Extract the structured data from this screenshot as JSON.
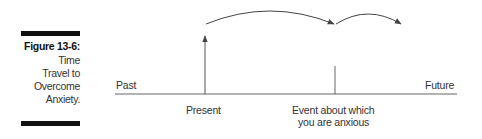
{
  "figure": {
    "number": "Figure 13-6:",
    "caption_lines": [
      "Time",
      "Travel to",
      "Overcome",
      "Anxiety."
    ]
  },
  "diagram": {
    "timeline_labels": {
      "past": "Past",
      "future": "Future"
    },
    "markers": {
      "present": "Present",
      "event_line1": "Event about which",
      "event_line2": "you are anxious"
    },
    "colors": {
      "line": "#555555",
      "text": "#333333",
      "bar": "#111111"
    }
  }
}
